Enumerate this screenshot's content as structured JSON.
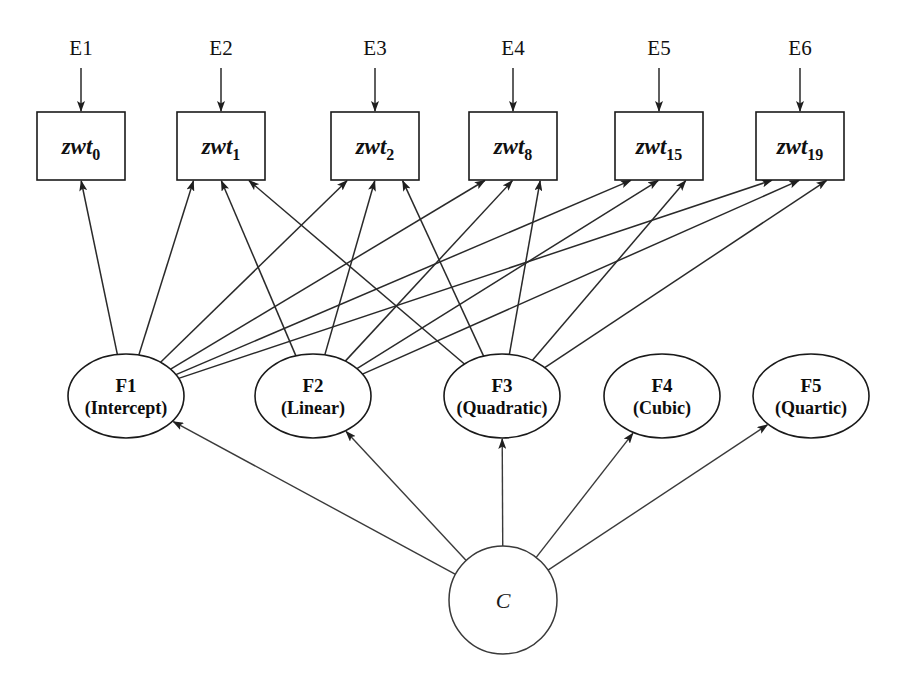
{
  "figure": {
    "type": "path-diagram",
    "subtype": "latent-growth-curve-sem",
    "background_color": "#ffffff",
    "line_color": "#2a2a2a",
    "text_color": "#111111"
  },
  "errors": [
    {
      "id": "E1",
      "label": "E1",
      "target": "zwt0"
    },
    {
      "id": "E2",
      "label": "E2",
      "target": "zwt1"
    },
    {
      "id": "E3",
      "label": "E3",
      "target": "zwt2"
    },
    {
      "id": "E4",
      "label": "E4",
      "target": "zwt8"
    },
    {
      "id": "E5",
      "label": "E5",
      "target": "zwt15"
    },
    {
      "id": "E6",
      "label": "E6",
      "target": "zwt19"
    }
  ],
  "indicators": [
    {
      "id": "zwt0",
      "stem": "zwt",
      "subscript": "0"
    },
    {
      "id": "zwt1",
      "stem": "zwt",
      "subscript": "1"
    },
    {
      "id": "zwt2",
      "stem": "zwt",
      "subscript": "2"
    },
    {
      "id": "zwt8",
      "stem": "zwt",
      "subscript": "8"
    },
    {
      "id": "zwt15",
      "stem": "zwt",
      "subscript": "15"
    },
    {
      "id": "zwt19",
      "stem": "zwt",
      "subscript": "19"
    }
  ],
  "factors": [
    {
      "id": "F1",
      "label": "F1",
      "sublabel": "(Intercept)"
    },
    {
      "id": "F2",
      "label": "F2",
      "sublabel": "(Linear)"
    },
    {
      "id": "F3",
      "label": "F3",
      "sublabel": "(Quadratic)"
    },
    {
      "id": "F4",
      "label": "F4",
      "sublabel": "(Cubic)"
    },
    {
      "id": "F5",
      "label": "F5",
      "sublabel": "(Quartic)"
    }
  ],
  "common_cause": {
    "id": "C",
    "label": "C"
  },
  "edges": {
    "error_to_indicator": [
      {
        "from": "E1",
        "to": "zwt0"
      },
      {
        "from": "E2",
        "to": "zwt1"
      },
      {
        "from": "E3",
        "to": "zwt2"
      },
      {
        "from": "E4",
        "to": "zwt8"
      },
      {
        "from": "E5",
        "to": "zwt15"
      },
      {
        "from": "E6",
        "to": "zwt19"
      }
    ],
    "factor_to_indicator": [
      {
        "from": "F1",
        "to": "zwt0"
      },
      {
        "from": "F1",
        "to": "zwt1"
      },
      {
        "from": "F1",
        "to": "zwt2"
      },
      {
        "from": "F1",
        "to": "zwt8"
      },
      {
        "from": "F1",
        "to": "zwt15"
      },
      {
        "from": "F1",
        "to": "zwt19"
      },
      {
        "from": "F2",
        "to": "zwt1"
      },
      {
        "from": "F2",
        "to": "zwt2"
      },
      {
        "from": "F2",
        "to": "zwt8"
      },
      {
        "from": "F2",
        "to": "zwt15"
      },
      {
        "from": "F2",
        "to": "zwt19"
      },
      {
        "from": "F3",
        "to": "zwt1"
      },
      {
        "from": "F3",
        "to": "zwt2"
      },
      {
        "from": "F3",
        "to": "zwt8"
      },
      {
        "from": "F3",
        "to": "zwt15"
      },
      {
        "from": "F3",
        "to": "zwt19"
      }
    ],
    "common_to_factor": [
      {
        "from": "C",
        "to": "F1"
      },
      {
        "from": "C",
        "to": "F2"
      },
      {
        "from": "C",
        "to": "F3"
      },
      {
        "from": "C",
        "to": "F4"
      },
      {
        "from": "C",
        "to": "F5"
      }
    ]
  },
  "geometry": {
    "box_width": 88,
    "box_height": 68,
    "box_top": 112,
    "box_centers_x": [
      81,
      221,
      375,
      513,
      659,
      800
    ],
    "error_label_y": 55,
    "error_arrow_top": 68,
    "ellipse_rx": 58,
    "ellipse_ry": 42,
    "ellipse_cy": 396,
    "ellipse_centers_x": [
      126,
      313,
      502,
      662,
      811
    ],
    "circle_cx": 503,
    "circle_cy": 600,
    "circle_r": 54
  }
}
